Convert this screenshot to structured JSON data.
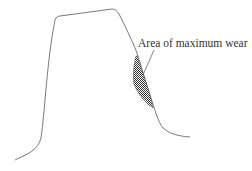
{
  "diagram": {
    "annotation": {
      "label": "Area of maximum wear"
    },
    "colors": {
      "outline": "#555555",
      "hatch": "#444444",
      "text": "#333333",
      "background": "#ffffff"
    }
  }
}
